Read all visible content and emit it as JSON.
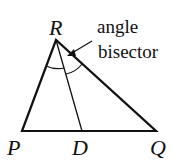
{
  "diagram": {
    "vertices": {
      "R": {
        "label": "R",
        "x": 56,
        "y": 40
      },
      "P": {
        "label": "P",
        "x": 22,
        "y": 131
      },
      "Q": {
        "label": "Q",
        "x": 156,
        "y": 131
      },
      "D": {
        "label": "D",
        "x": 82,
        "y": 131
      }
    },
    "annotation": {
      "line1": "angle",
      "line2": "bisector"
    },
    "colors": {
      "stroke": "#111111",
      "background": "#ffffff"
    }
  }
}
